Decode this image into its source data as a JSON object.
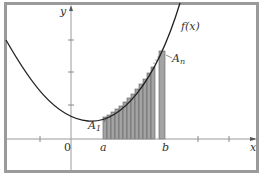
{
  "diagram": {
    "labels": {
      "y_axis": "y",
      "x_axis": "x",
      "function": "f(x)",
      "origin": "0",
      "a": "a",
      "b": "b",
      "first_rect": "A",
      "first_rect_sub": "1",
      "last_rect": "A",
      "last_rect_sub": "n"
    },
    "colors": {
      "frame": "#9a9a9a",
      "axis": "#9a9a9a",
      "curve": "#222222",
      "bar_fill": "#9e9e9e",
      "bar_stroke": "#5a5a5a"
    },
    "bars": {
      "count_visible": 14,
      "has_gap_before_last": true
    }
  }
}
